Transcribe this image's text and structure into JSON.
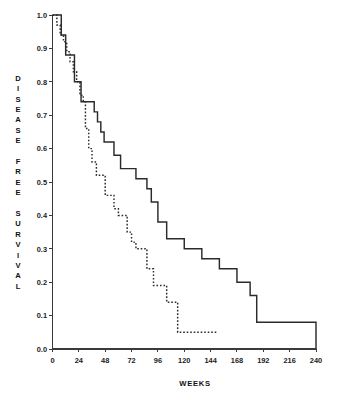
{
  "chart_data": {
    "type": "line",
    "title": "",
    "subtitle": "",
    "xlabel": "WEEKS",
    "ylabel": "DISEASE FREE SURVIVAL",
    "ylabel_words": [
      "DISEASE",
      "FREE",
      "SURVIVAL"
    ],
    "xlim": [
      0,
      240
    ],
    "ylim": [
      0.0,
      1.0
    ],
    "xticks": [
      0,
      24,
      48,
      72,
      96,
      120,
      144,
      168,
      192,
      216,
      240
    ],
    "xtick_labels": [
      "0",
      "24",
      "48",
      "72",
      "96",
      "120",
      "144",
      "168",
      "192",
      "216",
      "240"
    ],
    "yticks": [
      0.0,
      0.1,
      0.2,
      0.3,
      0.4,
      0.5,
      0.6,
      0.7,
      0.8,
      0.9,
      1.0
    ],
    "ytick_labels": [
      "0.0",
      "0.1",
      "0.2",
      "0.3",
      "0.4",
      "0.5",
      "0.6",
      "0.7",
      "0.8",
      "0.9",
      "1.0"
    ],
    "grid": false,
    "legend_position": "none",
    "axis_color": "#3a3a3a",
    "curve_color": "#2b2b2b",
    "step_interpolation": "post",
    "series": [
      {
        "name": "solid-curve",
        "style": "solid",
        "x": [
          0,
          4,
          8,
          12,
          16,
          20,
          26,
          32,
          36,
          38,
          41,
          44,
          47,
          50,
          56,
          62,
          68,
          76,
          80,
          86,
          90,
          92,
          96,
          104,
          112,
          120,
          128,
          136,
          144,
          152,
          160,
          168,
          172,
          180,
          186,
          240
        ],
        "y": [
          1.0,
          1.0,
          0.94,
          0.88,
          0.88,
          0.8,
          0.74,
          0.74,
          0.74,
          0.71,
          0.68,
          0.65,
          0.62,
          0.62,
          0.58,
          0.54,
          0.54,
          0.51,
          0.51,
          0.48,
          0.44,
          0.44,
          0.38,
          0.33,
          0.33,
          0.3,
          0.3,
          0.27,
          0.27,
          0.24,
          0.24,
          0.2,
          0.2,
          0.16,
          0.08,
          0.08
        ],
        "final_drop_to_zero": true,
        "final_x": 240
      },
      {
        "name": "dotted-curve",
        "style": "dotted",
        "x": [
          0,
          4,
          7,
          10,
          13,
          16,
          19,
          22,
          25,
          28,
          30,
          33,
          36,
          40,
          44,
          48,
          52,
          56,
          60,
          64,
          68,
          72,
          76,
          80,
          86,
          92,
          96,
          100,
          104,
          110,
          114,
          150
        ],
        "y": [
          1.0,
          0.97,
          0.94,
          0.92,
          0.89,
          0.86,
          0.83,
          0.8,
          0.76,
          0.74,
          0.66,
          0.6,
          0.56,
          0.52,
          0.52,
          0.46,
          0.46,
          0.42,
          0.4,
          0.4,
          0.35,
          0.32,
          0.3,
          0.3,
          0.24,
          0.19,
          0.19,
          0.19,
          0.14,
          0.14,
          0.05,
          0.05
        ],
        "censored_end": true
      }
    ],
    "annotations": []
  },
  "figure": {
    "caption": "",
    "background": "#ffffff"
  }
}
